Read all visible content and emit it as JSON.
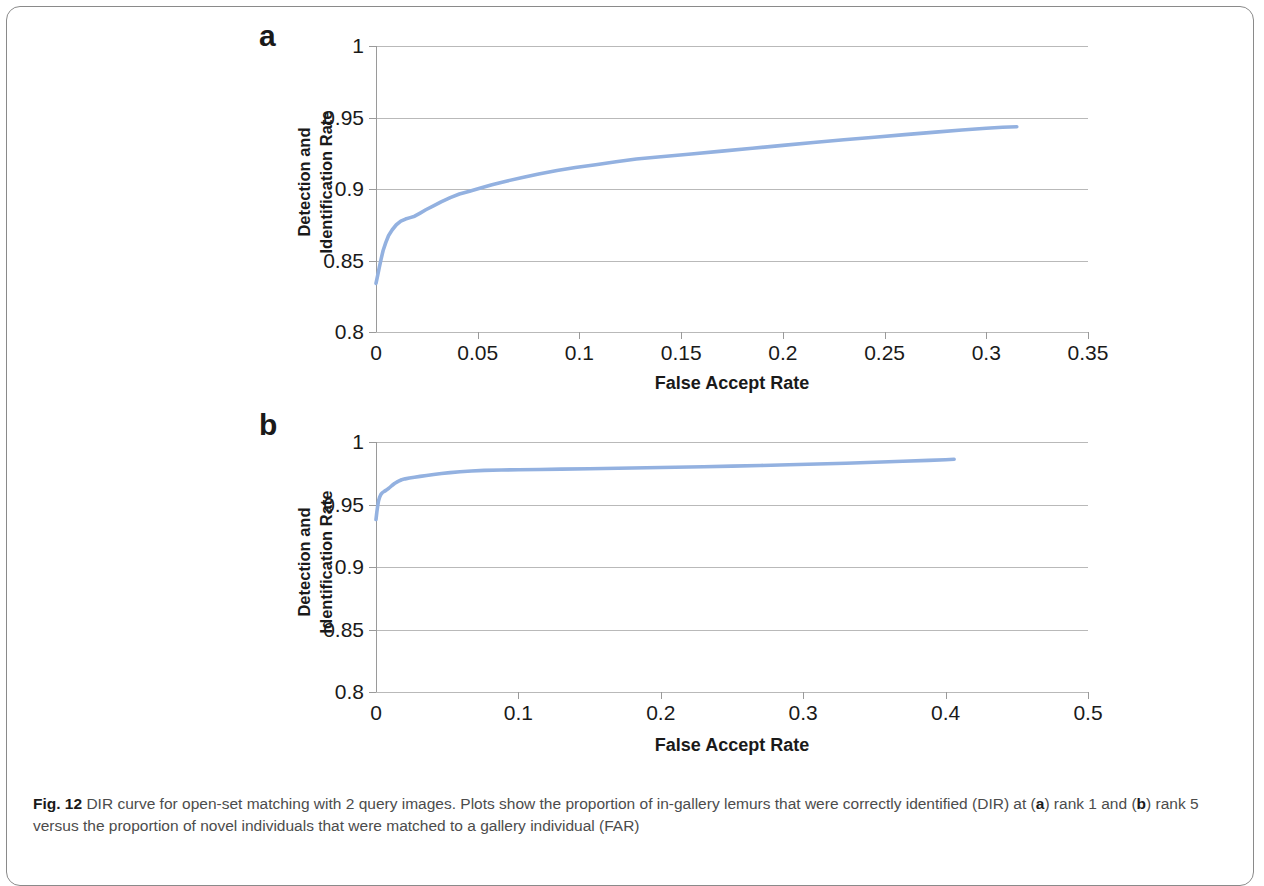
{
  "figure": {
    "caption_prefix": "Fig. 12",
    "caption_part1": " DIR curve for open-set matching with 2 query images. Plots show the proportion of in-gallery lemurs that were correctly identified (DIR) at (",
    "caption_bold_a": "a",
    "caption_part2": ") rank 1 and (",
    "caption_bold_b": "b",
    "caption_part3": ") rank 5 versus the proportion of novel individuals that were matched to a gallery individual (FAR)"
  },
  "panels": {
    "a": {
      "letter": "a"
    },
    "b": {
      "letter": "b"
    }
  },
  "chart_data": [
    {
      "type": "line",
      "panel": "a",
      "title": "",
      "xlabel": "False Accept Rate",
      "ylabel": "Detection and Identification Rate",
      "ylabel_line1": "Detection and",
      "ylabel_line2": "Identification Rate",
      "xlim": [
        0,
        0.35
      ],
      "ylim": [
        0.8,
        1
      ],
      "xticks": [
        "0",
        "0.05",
        "0.1",
        "0.15",
        "0.2",
        "0.25",
        "0.3",
        "0.35"
      ],
      "xtick_values": [
        0,
        0.05,
        0.1,
        0.15,
        0.2,
        0.25,
        0.3,
        0.35
      ],
      "yticks": [
        "0.8",
        "0.85",
        "0.9",
        "0.95",
        "1"
      ],
      "ytick_values": [
        0.8,
        0.85,
        0.9,
        0.95,
        1
      ],
      "grid": true,
      "legend": "none",
      "series_color": "#93b1e0",
      "series": [
        {
          "name": "DIR rank 1",
          "x": [
            0.0,
            0.0008,
            0.0016,
            0.0025,
            0.0035,
            0.0048,
            0.0062,
            0.008,
            0.01,
            0.0122,
            0.0145,
            0.0168,
            0.019,
            0.0215,
            0.0245,
            0.028,
            0.032,
            0.0365,
            0.041,
            0.046,
            0.051,
            0.057,
            0.064,
            0.072,
            0.08,
            0.089,
            0.098,
            0.108,
            0.118,
            0.128,
            0.14,
            0.155,
            0.17,
            0.185,
            0.2,
            0.215,
            0.23,
            0.245,
            0.26,
            0.275,
            0.288,
            0.3,
            0.308,
            0.315
          ],
          "y": [
            0.834,
            0.8395,
            0.845,
            0.851,
            0.857,
            0.8625,
            0.8675,
            0.8715,
            0.875,
            0.8775,
            0.879,
            0.88,
            0.881,
            0.883,
            0.8855,
            0.888,
            0.891,
            0.894,
            0.8965,
            0.8985,
            0.9005,
            0.903,
            0.9055,
            0.908,
            0.9105,
            0.913,
            0.915,
            0.917,
            0.919,
            0.921,
            0.9225,
            0.9245,
            0.9265,
            0.9285,
            0.9305,
            0.9325,
            0.9345,
            0.9362,
            0.938,
            0.9398,
            0.9412,
            0.9425,
            0.9432,
            0.9435
          ]
        }
      ]
    },
    {
      "type": "line",
      "panel": "b",
      "title": "",
      "xlabel": "False Accept Rate",
      "ylabel": "Detection and Identification Rate",
      "ylabel_line1": "Detection and",
      "ylabel_line2": "Identification Rate",
      "xlim": [
        0,
        0.5
      ],
      "ylim": [
        0.8,
        1
      ],
      "xticks": [
        "0",
        "0.1",
        "0.2",
        "0.3",
        "0.4",
        "0.5"
      ],
      "xtick_values": [
        0,
        0.1,
        0.2,
        0.3,
        0.4,
        0.5
      ],
      "yticks": [
        "0.8",
        "0.85",
        "0.9",
        "0.95",
        "1"
      ],
      "ytick_values": [
        0.8,
        0.85,
        0.9,
        0.95,
        1
      ],
      "grid": true,
      "legend": "none",
      "series_color": "#93b1e0",
      "series": [
        {
          "name": "DIR rank 5",
          "x": [
            0.0,
            0.0006,
            0.0012,
            0.0018,
            0.0026,
            0.0035,
            0.0045,
            0.0058,
            0.0072,
            0.009,
            0.011,
            0.013,
            0.0155,
            0.018,
            0.0205,
            0.0235,
            0.027,
            0.031,
            0.0355,
            0.0405,
            0.046,
            0.052,
            0.059,
            0.067,
            0.076,
            0.088,
            0.1,
            0.115,
            0.13,
            0.15,
            0.17,
            0.19,
            0.21,
            0.23,
            0.25,
            0.27,
            0.29,
            0.31,
            0.33,
            0.35,
            0.37,
            0.388,
            0.4,
            0.406
          ],
          "y": [
            0.938,
            0.944,
            0.949,
            0.953,
            0.956,
            0.9582,
            0.9595,
            0.9605,
            0.9615,
            0.963,
            0.965,
            0.9668,
            0.9685,
            0.9698,
            0.9705,
            0.9712,
            0.9718,
            0.9725,
            0.9732,
            0.974,
            0.9748,
            0.9755,
            0.9762,
            0.9768,
            0.9773,
            0.9776,
            0.9778,
            0.978,
            0.9783,
            0.9786,
            0.979,
            0.9794,
            0.9798,
            0.9802,
            0.9807,
            0.9812,
            0.9818,
            0.9824,
            0.983,
            0.9838,
            0.9846,
            0.9853,
            0.9858,
            0.9862
          ]
        }
      ]
    }
  ]
}
